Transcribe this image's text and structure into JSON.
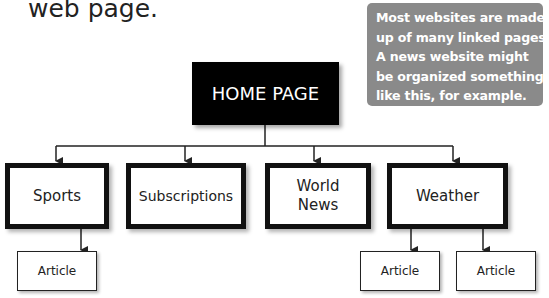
{
  "heading": {
    "text": "web page."
  },
  "note": {
    "lines": [
      "Most websites are made",
      "up of many linked pages.",
      "A news website might",
      "be organized something",
      "like this, for example."
    ],
    "background": "#8a8a8a"
  },
  "diagram": {
    "root": {
      "label": "HOME PAGE"
    },
    "sections": [
      {
        "label_line1": "Sports",
        "label_line2": ""
      },
      {
        "label_line1": "Subscriptions",
        "label_line2": ""
      },
      {
        "label_line1": "World",
        "label_line2": "News"
      },
      {
        "label_line1": "Weather",
        "label_line2": ""
      }
    ],
    "articles": [
      {
        "label": "Article",
        "parent": "Sports"
      },
      {
        "label": "Article",
        "parent": "Weather"
      },
      {
        "label": "Article",
        "parent": "Weather"
      }
    ]
  }
}
